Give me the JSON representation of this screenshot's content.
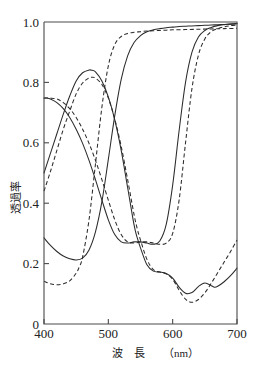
{
  "chart_data": {
    "type": "line",
    "title": "",
    "xlabel": "波　長（nm）",
    "ylabel": "透過率",
    "xlim": [
      400,
      700
    ],
    "ylim": [
      0,
      1.0
    ],
    "xticks": [
      400,
      500,
      600,
      700
    ],
    "xtick_labels": [
      "400",
      "500",
      "600",
      "700"
    ],
    "yticks": [
      0,
      0.2,
      0.4,
      0.6,
      0.8,
      1.0
    ],
    "ytick_labels": [
      "0",
      "0.2",
      "0.4",
      "0.6",
      "0.8",
      "1.0"
    ],
    "grid": false,
    "legend": "none",
    "series": [
      {
        "name": "blue-solid",
        "style": "solid",
        "x": [
          400,
          410,
          420,
          430,
          440,
          450,
          460,
          470,
          475,
          480,
          490,
          500,
          510,
          520,
          530,
          540,
          545,
          550,
          560,
          570,
          580,
          590,
          600,
          610,
          620,
          630,
          640,
          650,
          660,
          665,
          670,
          680,
          690,
          700
        ],
        "y": [
          0.5,
          0.565,
          0.63,
          0.695,
          0.755,
          0.805,
          0.832,
          0.841,
          0.84,
          0.835,
          0.805,
          0.752,
          0.676,
          0.575,
          0.452,
          0.328,
          0.285,
          0.252,
          0.196,
          0.175,
          0.172,
          0.167,
          0.152,
          0.122,
          0.102,
          0.104,
          0.124,
          0.136,
          0.127,
          0.122,
          0.125,
          0.14,
          0.16,
          0.185
        ]
      },
      {
        "name": "blue-dashed",
        "style": "dashed",
        "x": [
          400,
          410,
          420,
          430,
          440,
          450,
          460,
          470,
          475,
          480,
          490,
          500,
          510,
          520,
          530,
          540,
          545,
          550,
          560,
          570,
          580,
          590,
          600,
          610,
          620,
          630,
          640,
          650,
          660,
          670,
          680,
          690,
          700
        ],
        "y": [
          0.44,
          0.505,
          0.575,
          0.645,
          0.705,
          0.762,
          0.798,
          0.815,
          0.817,
          0.814,
          0.793,
          0.748,
          0.678,
          0.588,
          0.478,
          0.362,
          0.315,
          0.278,
          0.214,
          0.18,
          0.172,
          0.166,
          0.148,
          0.112,
          0.082,
          0.072,
          0.081,
          0.103,
          0.135,
          0.17,
          0.205,
          0.24,
          0.278
        ]
      },
      {
        "name": "green-solid",
        "style": "solid",
        "x": [
          400,
          410,
          420,
          430,
          440,
          450,
          460,
          470,
          480,
          490,
          500,
          510,
          520,
          530,
          540,
          550,
          560,
          570,
          580,
          590,
          600,
          610,
          620,
          630,
          640,
          650,
          660,
          670,
          680,
          690,
          700
        ],
        "y": [
          0.285,
          0.26,
          0.24,
          0.225,
          0.216,
          0.212,
          0.218,
          0.245,
          0.305,
          0.405,
          0.545,
          0.69,
          0.81,
          0.888,
          0.932,
          0.955,
          0.968,
          0.974,
          0.978,
          0.981,
          0.983,
          0.985,
          0.986,
          0.987,
          0.988,
          0.989,
          0.99,
          0.991,
          0.992,
          0.993,
          0.994
        ]
      },
      {
        "name": "green-dashed",
        "style": "dashed",
        "x": [
          400,
          410,
          420,
          430,
          440,
          450,
          455,
          460,
          470,
          480,
          490,
          500,
          510,
          520,
          530,
          540,
          550,
          560,
          570,
          580,
          590,
          600,
          620,
          640,
          660,
          680,
          700
        ],
        "y": [
          0.142,
          0.133,
          0.13,
          0.133,
          0.143,
          0.168,
          0.19,
          0.222,
          0.345,
          0.53,
          0.718,
          0.855,
          0.925,
          0.952,
          0.962,
          0.966,
          0.968,
          0.97,
          0.971,
          0.972,
          0.973,
          0.974,
          0.975,
          0.976,
          0.977,
          0.978,
          0.979
        ]
      },
      {
        "name": "red-solid",
        "style": "solid",
        "x": [
          400,
          405,
          410,
          420,
          430,
          440,
          450,
          460,
          470,
          480,
          490,
          500,
          510,
          520,
          530,
          540,
          550,
          560,
          570,
          580,
          590,
          600,
          610,
          620,
          630,
          640,
          650,
          660,
          670,
          680,
          690,
          700
        ],
        "y": [
          0.748,
          0.748,
          0.745,
          0.733,
          0.713,
          0.684,
          0.645,
          0.598,
          0.542,
          0.478,
          0.41,
          0.345,
          0.296,
          0.272,
          0.268,
          0.272,
          0.272,
          0.268,
          0.264,
          0.275,
          0.33,
          0.46,
          0.64,
          0.8,
          0.9,
          0.95,
          0.972,
          0.982,
          0.988,
          0.991,
          0.993,
          0.995
        ]
      },
      {
        "name": "red-dashed",
        "style": "dashed",
        "x": [
          400,
          410,
          420,
          430,
          440,
          450,
          460,
          470,
          480,
          490,
          500,
          510,
          520,
          530,
          540,
          550,
          560,
          570,
          580,
          590,
          600,
          610,
          620,
          630,
          640,
          650,
          660,
          670,
          680,
          690,
          700
        ],
        "y": [
          0.748,
          0.748,
          0.745,
          0.733,
          0.713,
          0.684,
          0.645,
          0.598,
          0.542,
          0.478,
          0.41,
          0.345,
          0.296,
          0.272,
          0.268,
          0.272,
          0.272,
          0.268,
          0.264,
          0.268,
          0.3,
          0.41,
          0.6,
          0.78,
          0.89,
          0.944,
          0.968,
          0.978,
          0.984,
          0.988,
          0.99
        ]
      }
    ]
  },
  "axes": {
    "x_title_main": "波　長",
    "x_title_unit": "（nm）",
    "y_title": "透過率"
  },
  "colors": {
    "curve": "#2b2b2b",
    "axis": "#4a4a4a",
    "background": "#ffffff"
  }
}
